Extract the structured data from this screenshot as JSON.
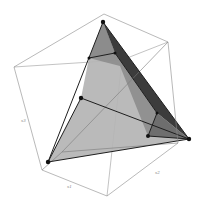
{
  "figure": {
    "type": "3d-polytope-in-cube",
    "colors": {
      "background": "#ffffff",
      "cube_edge": "#8a8a8a",
      "facet_light": "#b4b4b4",
      "facet_mid": "#8c8c8c",
      "facet_dark": "#5a5a5a",
      "facet_darkest": "#3c3c3c",
      "edge": "#1e1e1e",
      "vertex": "#111111"
    },
    "axis_labels": [
      {
        "id": "left-edge-label",
        "text": "x3"
      },
      {
        "id": "bottom-left-edge-label",
        "text": "x1"
      },
      {
        "id": "bottom-right-edge-label",
        "text": "x2"
      }
    ],
    "cube_vertices": {
      "top": [
        104,
        14
      ],
      "upper_right": [
        168,
        42
      ],
      "right": [
        178,
        143
      ],
      "bottom": [
        107,
        196
      ],
      "lower_left": [
        42,
        170
      ],
      "left": [
        14,
        67
      ],
      "inner_a": [
        122,
        60
      ],
      "inner_b": [
        62,
        152
      ]
    },
    "polytope_vertices": [
      {
        "id": "v-top",
        "xy": [
          103,
          22
        ]
      },
      {
        "id": "v-upper-left",
        "xy": [
          89,
          58
        ]
      },
      {
        "id": "v-upper-inner",
        "xy": [
          115,
          53
        ]
      },
      {
        "id": "v-middle",
        "xy": [
          81,
          98
        ]
      },
      {
        "id": "v-right",
        "xy": [
          189,
          139
        ]
      },
      {
        "id": "v-lower-inner",
        "xy": [
          148,
          136
        ]
      },
      {
        "id": "v-right-inner",
        "xy": [
          157,
          113
        ]
      },
      {
        "id": "v-bottom-left",
        "xy": [
          48,
          162
        ]
      }
    ]
  }
}
